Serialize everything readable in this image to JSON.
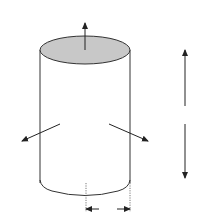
{
  "diagram": {
    "labels": {
      "z_axis": "z",
      "x_axis": "x",
      "y_axis": "y",
      "height": "h",
      "radius": "R"
    },
    "colors": {
      "top_face": "#c8c8c8",
      "stroke": "#333333"
    }
  }
}
